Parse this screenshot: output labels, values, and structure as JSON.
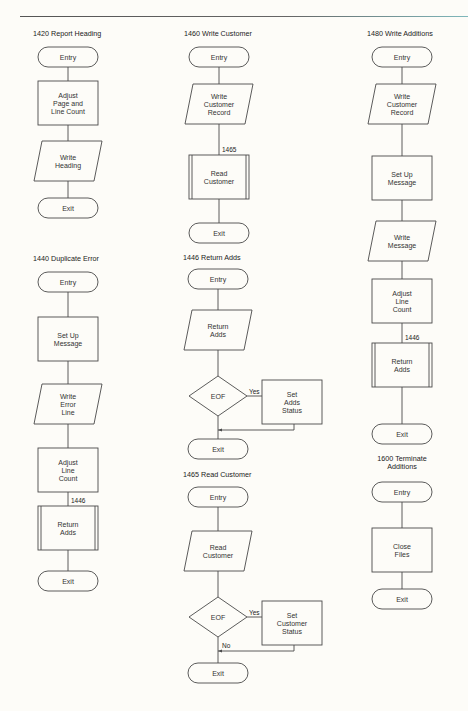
{
  "modules": [
    {
      "id": "m1420",
      "title": "1420 Report Heading",
      "steps": [
        {
          "type": "terminal",
          "text": [
            "Entry"
          ]
        },
        {
          "type": "process",
          "text": [
            "Adjust",
            "Page and",
            "Line Count"
          ]
        },
        {
          "type": "io",
          "text": [
            "Write",
            "Heading"
          ]
        },
        {
          "type": "terminal",
          "text": [
            "Exit"
          ]
        }
      ]
    },
    {
      "id": "m1440",
      "title": "1440 Duplicate Error",
      "steps": [
        {
          "type": "terminal",
          "text": [
            "Entry"
          ]
        },
        {
          "type": "process",
          "text": [
            "Set Up",
            "Message"
          ]
        },
        {
          "type": "io",
          "text": [
            "Write",
            "Error",
            "Line"
          ]
        },
        {
          "type": "process",
          "text": [
            "Adjust",
            "Line",
            "Count"
          ]
        },
        {
          "type": "subroutine",
          "ref": "1446",
          "text": [
            "Return",
            "Adds"
          ]
        },
        {
          "type": "terminal",
          "text": [
            "Exit"
          ]
        }
      ]
    },
    {
      "id": "m1460",
      "title": "1460 Write Customer",
      "steps": [
        {
          "type": "terminal",
          "text": [
            "Entry"
          ]
        },
        {
          "type": "io",
          "text": [
            "Write",
            "Customer",
            "Record"
          ]
        },
        {
          "type": "subroutine",
          "ref": "1465",
          "text": [
            "Read",
            "Customer"
          ]
        },
        {
          "type": "terminal",
          "text": [
            "Exit"
          ]
        }
      ]
    },
    {
      "id": "m1446",
      "title": "1446 Return Adds",
      "steps": [
        {
          "type": "terminal",
          "text": [
            "Entry"
          ]
        },
        {
          "type": "io",
          "text": [
            "Return",
            "Adds"
          ]
        },
        {
          "type": "decision",
          "text": [
            "EOF"
          ],
          "yes_label": "Yes",
          "no_label": "",
          "yes_action": {
            "type": "process",
            "text": [
              "Set",
              "Adds",
              "Status"
            ]
          }
        },
        {
          "type": "terminal",
          "text": [
            "Exit"
          ]
        }
      ]
    },
    {
      "id": "m1465",
      "title": "1465 Read Customer",
      "steps": [
        {
          "type": "terminal",
          "text": [
            "Entry"
          ]
        },
        {
          "type": "io",
          "text": [
            "Read",
            "Customer"
          ]
        },
        {
          "type": "decision",
          "text": [
            "EOF"
          ],
          "yes_label": "Yes",
          "no_label": "No",
          "yes_action": {
            "type": "process",
            "text": [
              "Set",
              "Customer",
              "Status"
            ]
          }
        },
        {
          "type": "terminal",
          "text": [
            "Exit"
          ]
        }
      ]
    },
    {
      "id": "m1480",
      "title": "1480 Write Additions",
      "steps": [
        {
          "type": "terminal",
          "text": [
            "Entry"
          ]
        },
        {
          "type": "io",
          "text": [
            "Write",
            "Customer",
            "Record"
          ]
        },
        {
          "type": "process",
          "text": [
            "Set Up",
            "Message"
          ]
        },
        {
          "type": "io",
          "text": [
            "Write",
            "Message"
          ]
        },
        {
          "type": "process",
          "text": [
            "Adjust",
            "Line",
            "Count"
          ]
        },
        {
          "type": "subroutine",
          "ref": "1446",
          "text": [
            "Return",
            "Adds"
          ]
        },
        {
          "type": "terminal",
          "text": [
            "Exit"
          ]
        }
      ]
    },
    {
      "id": "m1600",
      "title": "1600 Terminate Additions",
      "title_lines": [
        "1600 Terminate",
        "Additions"
      ],
      "steps": [
        {
          "type": "terminal",
          "text": [
            "Entry"
          ]
        },
        {
          "type": "process",
          "text": [
            "Close",
            "Files"
          ]
        },
        {
          "type": "terminal",
          "text": [
            "Exit"
          ]
        }
      ]
    }
  ],
  "colors": {
    "paper": "#fdfcf8",
    "ink": "#4a4a4a",
    "text": "#2a2a2a"
  }
}
